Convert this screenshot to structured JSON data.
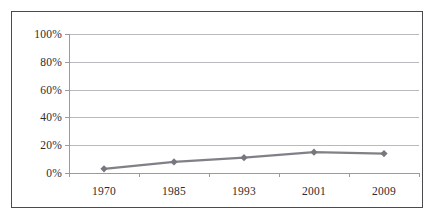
{
  "chart_data": {
    "type": "line",
    "title": "",
    "subtitle": "",
    "xlabel": "",
    "ylabel": "",
    "categories": [
      "1970",
      "1985",
      "1993",
      "2001",
      "2009"
    ],
    "values": [
      3,
      8,
      11,
      15,
      14
    ],
    "series": [
      {
        "name": "",
        "values": [
          3,
          8,
          11,
          15,
          14
        ]
      }
    ],
    "ylim": [
      0,
      100
    ],
    "y_ticks": [
      0,
      20,
      40,
      60,
      80,
      100
    ],
    "y_tick_labels": [
      "0%",
      "20%",
      "40%",
      "60%",
      "80%",
      "100%"
    ],
    "x_tick_labels": [
      "1970",
      "1985",
      "1993",
      "2001",
      "2009"
    ],
    "grid": true,
    "grid_axis": "y",
    "legend": false,
    "legend_position": "none",
    "annotations": [],
    "colors": {
      "series_line": "#808088",
      "marker": "#777780",
      "gridline": "#b8b8bd",
      "axis": "#9a9aa0",
      "frame_border": "#4a4a52",
      "text": "#2b2b30",
      "plot_background": "#ffffff"
    }
  }
}
